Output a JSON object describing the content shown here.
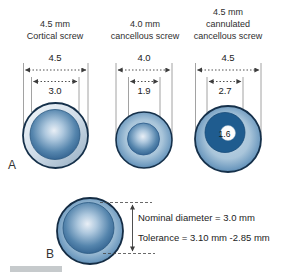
{
  "figure": {
    "panel_a_label": "A",
    "panel_b_label": "B"
  },
  "columns": [
    {
      "header_lines": [
        "4.5 mm",
        "Cortical screw"
      ],
      "outer_diameter": "4.5",
      "core_diameter": "3.0"
    },
    {
      "header_lines": [
        "4.0 mm",
        "cancellous screw"
      ],
      "outer_diameter": "4.0",
      "core_diameter": "1.9"
    },
    {
      "header_lines": [
        "4.5 mm",
        "cannulated",
        "cancellous screw"
      ],
      "outer_diameter": "4.5",
      "core_diameter": "2.7",
      "cannulation_diameter": "1.6"
    }
  ],
  "panel_b": {
    "nominal_label": "Nominal diameter = 3.0 mm",
    "tolerance_label": "Tolerance = 3.10 mm -2.85 mm"
  },
  "colors": {
    "outline_navy": "#15304a",
    "sphere_blue": "#2f5f8d",
    "sphere_highlight": "#e9eff6",
    "dark_core_blue": "#1f5c8f",
    "text": "#2e2e2e"
  }
}
